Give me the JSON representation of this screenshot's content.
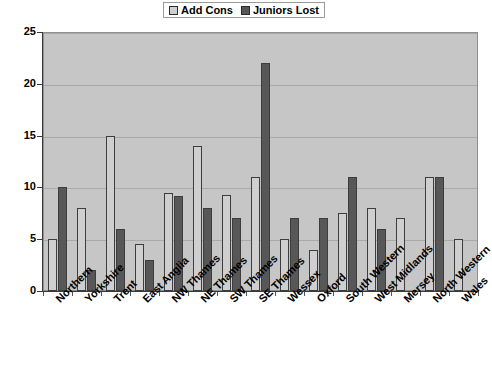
{
  "chart_data": {
    "type": "bar",
    "title": "",
    "xlabel": "",
    "ylabel": "",
    "ylim": [
      0,
      25
    ],
    "yticks": [
      0,
      5,
      10,
      15,
      20,
      25
    ],
    "grid": true,
    "legend_position": "top-center",
    "categories": [
      "Northern",
      "Yorkshire",
      "Trent",
      "East Anglia",
      "NW Thames",
      "NE Thames",
      "SW Thames",
      "SE Thames",
      "Wessex",
      "Oxford",
      "South Western",
      "West Midlands",
      "Mersey",
      "North Western",
      "Wales"
    ],
    "series": [
      {
        "name": "Add Cons",
        "color": "#cfcfcf",
        "values": [
          5,
          8,
          15,
          4.5,
          9.5,
          14,
          9.3,
          11,
          5,
          4,
          7.5,
          8,
          7,
          11,
          5
        ]
      },
      {
        "name": "Juniors Lost",
        "color": "#575757",
        "values": [
          10,
          2,
          6,
          3,
          9.2,
          8,
          7,
          22,
          7,
          7,
          11,
          6,
          null,
          11,
          null
        ]
      }
    ]
  },
  "legend": {
    "items": [
      {
        "label": "Add Cons",
        "swatch": "#cfcfcf"
      },
      {
        "label": "Juniors Lost",
        "swatch": "#575757"
      }
    ]
  },
  "axes": {
    "y_tick_labels": [
      "25",
      "20",
      "15",
      "10",
      "5",
      "0"
    ]
  }
}
